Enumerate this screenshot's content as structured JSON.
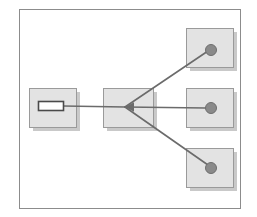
{
  "figure": {
    "type": "node-link-diagram",
    "width": 257,
    "height": 217,
    "background_color": "#ffffff"
  },
  "frame": {
    "label": "outer-frame",
    "x": 19,
    "y": 9,
    "width": 221,
    "height": 199,
    "stroke_color": "#8c8c8c",
    "fill_color": "#ffffff",
    "stroke_width": 1
  },
  "style": {
    "box_fill": "#e3e3e3",
    "box_stroke": "#9a9a9a",
    "box_shadow": "#c9c9c9",
    "shadow_offset_x": 4,
    "shadow_offset_y": 4,
    "node_fill": "#8a8a8a",
    "node_stroke": "#6e6e6e",
    "edge_color": "#6b6b6b",
    "edge_width": 1.6,
    "slot_fill": "#ffffff",
    "slot_stroke": "#4a4a4a"
  },
  "boxes": [
    {
      "id": "box-source",
      "label": "source-box",
      "x": 29,
      "y": 88,
      "width": 47,
      "height": 39,
      "content": "slot"
    },
    {
      "id": "box-hub",
      "label": "hub-box",
      "x": 103,
      "y": 88,
      "width": 50,
      "height": 39,
      "content": "junction"
    },
    {
      "id": "box-target-top",
      "label": "target-box-top",
      "x": 186,
      "y": 28,
      "width": 47,
      "height": 39,
      "content": "node"
    },
    {
      "id": "box-target-middle",
      "label": "target-box-middle",
      "x": 186,
      "y": 88,
      "width": 47,
      "height": 39,
      "content": "node"
    },
    {
      "id": "box-target-bottom",
      "label": "target-box-bottom",
      "x": 186,
      "y": 148,
      "width": 47,
      "height": 39,
      "content": "node"
    }
  ],
  "slot": {
    "label": "source-slot",
    "x": 38,
    "y": 101,
    "width": 25,
    "height": 9
  },
  "nodes": [
    {
      "id": "node-top",
      "label": "node-top",
      "cx": 211,
      "cy": 50,
      "r": 5.5
    },
    {
      "id": "node-middle",
      "label": "node-middle",
      "cx": 211,
      "cy": 108,
      "r": 5.5
    },
    {
      "id": "node-bottom",
      "label": "node-bottom",
      "cx": 211,
      "cy": 168,
      "r": 5.5
    }
  ],
  "junction": {
    "label": "convergence-point",
    "x": 125,
    "y": 107
  },
  "edges": [
    {
      "id": "edge-source-hub",
      "label": "edge-source-to-hub",
      "x1": 63,
      "y1": 106,
      "x2": 125,
      "y2": 107,
      "arrow": false
    },
    {
      "id": "edge-hub-top",
      "label": "edge-hub-to-node-top",
      "x1": 125,
      "y1": 107,
      "x2": 208,
      "y2": 51,
      "arrow": true
    },
    {
      "id": "edge-hub-middle",
      "label": "edge-hub-to-node-middle",
      "x1": 125,
      "y1": 107,
      "x2": 206,
      "y2": 108,
      "arrow": true
    },
    {
      "id": "edge-hub-bottom",
      "label": "edge-hub-to-node-bottom",
      "x1": 125,
      "y1": 107,
      "x2": 208,
      "y2": 165,
      "arrow": true
    }
  ],
  "arrowhead": {
    "label": "arrowhead-at-junction",
    "tip_x": 125,
    "tip_y": 107,
    "size": 9
  }
}
